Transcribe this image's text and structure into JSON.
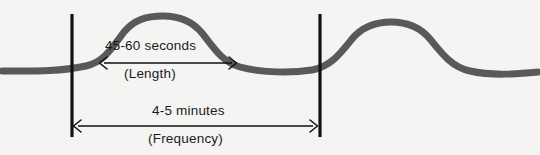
{
  "diagram": {
    "background_color": "#f4f4f2",
    "wave": {
      "name": "contraction-wave",
      "color": "#58595b",
      "stroke_width": 7,
      "baseline_y": 70,
      "peak_y": 19,
      "description": "two rounded contraction peaks on a flat baseline"
    },
    "markers": [
      {
        "name": "contraction-start-line",
        "x": 72,
        "top": 14,
        "bottom": 137,
        "color": "#111111",
        "width": 3
      },
      {
        "name": "contraction-next-start-line",
        "x": 320,
        "top": 14,
        "bottom": 137,
        "color": "#111111",
        "width": 3
      }
    ],
    "measurements": [
      {
        "id": "length",
        "value_label": "45-60 seconds",
        "name_label": "(Length)",
        "arrow": {
          "name": "length-arrow",
          "x1": 100,
          "x2": 236,
          "y": 63,
          "color": "#111111",
          "double_headed": true
        }
      },
      {
        "id": "frequency",
        "value_label": "4-5 minutes",
        "name_label": "(Frequency)",
        "arrow": {
          "name": "frequency-arrow",
          "x1": 74,
          "x2": 317,
          "y": 126,
          "color": "#111111",
          "double_headed": true
        }
      }
    ]
  }
}
